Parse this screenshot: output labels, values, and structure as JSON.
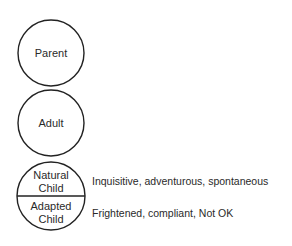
{
  "diagram": {
    "states": [
      {
        "label": "Parent"
      },
      {
        "label": "Adult"
      },
      {
        "label": "Natural Child",
        "line1": "Natural",
        "line2": "Child",
        "description": "Inquisitive, adventurous, spontaneous"
      },
      {
        "label": "Adapted Child",
        "line1": "Adapted",
        "line2": "Child",
        "description": "Frightened, compliant, Not OK"
      }
    ],
    "colors": {
      "stroke": "#222222",
      "text": "#2a2a2a",
      "background": "#ffffff"
    }
  }
}
